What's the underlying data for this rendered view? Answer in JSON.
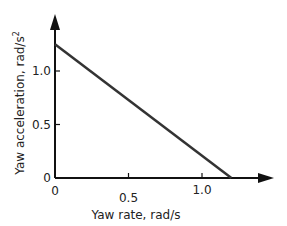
{
  "chart_data": {
    "type": "line",
    "title": "",
    "xlabel": "Yaw rate, rad/s",
    "ylabel": "Yaw acceleration, rad/s",
    "ylabel_superscript": "2",
    "xlim": [
      0,
      1.45
    ],
    "ylim": [
      0,
      1.52
    ],
    "x_ticks": [
      0,
      0.5,
      1.0
    ],
    "x_tick_labels": [
      "0",
      "0.5",
      "1.0"
    ],
    "y_ticks": [
      0,
      0.5,
      1.0
    ],
    "y_tick_labels": [
      "0",
      "0.5",
      "1.0"
    ],
    "grid": false,
    "legend": null,
    "series": [
      {
        "name": "Yaw acceleration vs yaw rate",
        "x": [
          0,
          1.2
        ],
        "y": [
          1.25,
          0
        ],
        "color": "#333333"
      }
    ]
  },
  "colors": {
    "axis": "#111111",
    "line": "#333333",
    "text": "#222222"
  }
}
